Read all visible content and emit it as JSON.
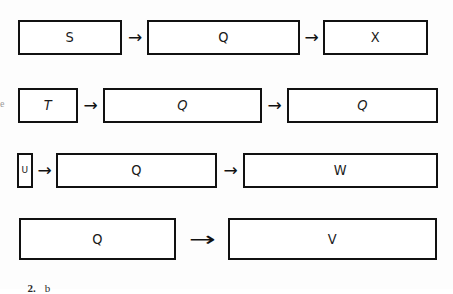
{
  "figure": {
    "background_color": "#fdfdfd",
    "stroke_color": "#111111",
    "caption_number": "2.",
    "caption_letter": "b",
    "edge_mark": "e"
  },
  "rows": [
    {
      "name": "row-1",
      "boxes": [
        {
          "label": "S",
          "x": 18,
          "y": 20,
          "w": 104,
          "h": 35
        },
        {
          "label": "Q",
          "x": 147,
          "y": 20,
          "w": 153,
          "h": 35
        },
        {
          "label": "X",
          "x": 323,
          "y": 20,
          "w": 105,
          "h": 35
        }
      ],
      "arrows": [
        {
          "x": 124,
          "y": 29,
          "w": 22,
          "h": 16,
          "long": false
        },
        {
          "x": 301,
          "y": 29,
          "w": 21,
          "h": 16,
          "long": false
        }
      ]
    },
    {
      "name": "row-2",
      "boxes": [
        {
          "label": "T",
          "x": 18,
          "y": 88,
          "w": 60,
          "h": 35,
          "slant": true
        },
        {
          "label": "Q",
          "x": 103,
          "y": 88,
          "w": 159,
          "h": 35,
          "slant": true
        },
        {
          "label": "Q",
          "x": 287,
          "y": 88,
          "w": 151,
          "h": 35,
          "slant": true
        }
      ],
      "arrows": [
        {
          "x": 79,
          "y": 97,
          "w": 23,
          "h": 16,
          "long": false
        },
        {
          "x": 263,
          "y": 97,
          "w": 23,
          "h": 16,
          "long": false
        }
      ]
    },
    {
      "name": "row-3",
      "boxes": [
        {
          "label": "U",
          "x": 17,
          "y": 153,
          "w": 16,
          "h": 35,
          "tiny": true
        },
        {
          "label": "Q",
          "x": 56,
          "y": 153,
          "w": 161,
          "h": 35
        },
        {
          "label": "W",
          "x": 243,
          "y": 153,
          "w": 195,
          "h": 35
        }
      ],
      "arrows": [
        {
          "x": 34,
          "y": 162,
          "w": 21,
          "h": 16,
          "long": false
        },
        {
          "x": 219,
          "y": 162,
          "w": 23,
          "h": 16,
          "long": false
        }
      ]
    },
    {
      "name": "row-4",
      "boxes": [
        {
          "label": "Q",
          "x": 19,
          "y": 218,
          "w": 157,
          "h": 42
        },
        {
          "label": "V",
          "x": 228,
          "y": 218,
          "w": 209,
          "h": 42
        }
      ],
      "arrows": [
        {
          "x": 184,
          "y": 230,
          "w": 36,
          "h": 18,
          "long": true
        }
      ]
    }
  ],
  "caption": {
    "x": 22,
    "y": 270
  },
  "edge_mark_pos": {
    "x": 0,
    "y": 98
  }
}
